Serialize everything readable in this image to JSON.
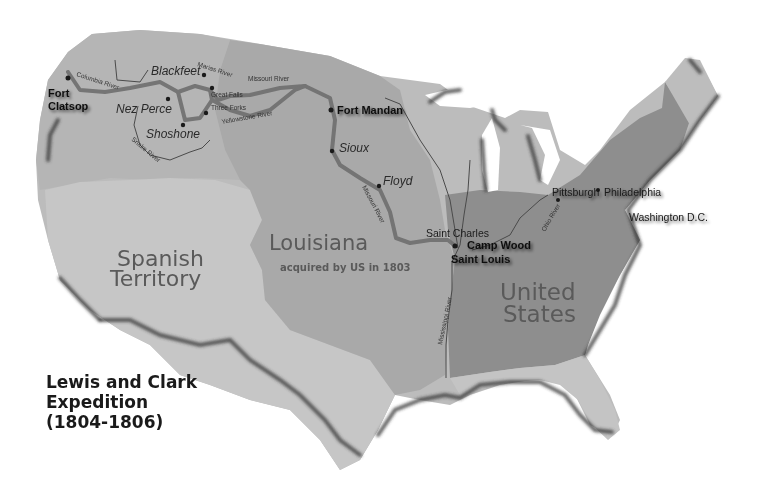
{
  "title": {
    "line1": "Lewis and Clark",
    "line2": "Expedition",
    "line3": "(1804-1806)"
  },
  "regions": {
    "spanish": {
      "line1": "Spanish",
      "line2": "Territory",
      "color": "#c4c4c4"
    },
    "louisiana": {
      "name": "Louisiana",
      "subtitle": "acquired by US in 1803",
      "color": "#a8a8a8"
    },
    "united_states": {
      "line1": "United",
      "line2": "States",
      "color": "#8c8c8c"
    },
    "northwest": {
      "color": "#b5b5b5"
    },
    "other_us": {
      "color": "#bcbcbc"
    }
  },
  "forts": {
    "fort_clatsop_line1": "Fort",
    "fort_clatsop_line2": "Clatsop",
    "fort_mandan": "Fort Mandan",
    "camp_wood": "Camp Wood",
    "saint_louis": "Saint Louis"
  },
  "tribes": {
    "blackfeet": "Blackfeet",
    "nez_perce": "Nez Perce",
    "shoshone": "Shoshone",
    "sioux": "Sioux",
    "floyd": "Floyd"
  },
  "places": {
    "great_falls": "Great Falls",
    "three_forks": "Three Forks",
    "saint_charles": "Saint Charles",
    "pittsburgh": "Pittsburgh",
    "philadelphia": "Philadelphia",
    "washington": "Washington D.C."
  },
  "rivers": {
    "columbia": "Columbia River",
    "marias": "Marias River",
    "missouri_upper": "Missouri River",
    "yellowstone": "Yellowstone River",
    "snake": "Snake River",
    "missouri_lower": "Missouri River",
    "mississippi": "Mississippi River",
    "ohio": "Ohio River"
  },
  "colors": {
    "route": "#6e6e6e",
    "coast_shadow": "#333333",
    "background": "#ffffff"
  }
}
